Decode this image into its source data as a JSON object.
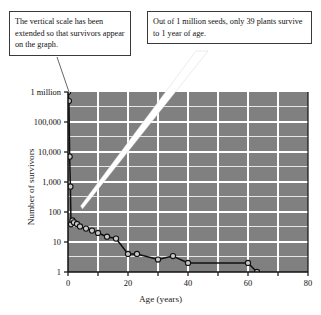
{
  "annotations": {
    "scale_note": "The vertical scale has been extended so that survivors appear on the graph.",
    "survival_note": "Out of 1 million seeds, only 39 plants survive to 1 year of age.",
    "caption": ""
  },
  "chart_data": {
    "type": "line",
    "title": "",
    "subtitle": "",
    "xlabel": "Age (years)",
    "ylabel": "Number of survivors",
    "xlim": [
      0,
      80
    ],
    "ylim": [
      1,
      1000000
    ],
    "yscale": "log",
    "grid": true,
    "legend": false,
    "plot_background": "#808080",
    "grid_color": "#ffffff",
    "marker": "open-circle",
    "x_ticks": [
      0,
      10,
      20,
      30,
      40,
      50,
      60,
      70,
      80
    ],
    "x_tick_labels": [
      "0",
      "",
      "20",
      "",
      "40",
      "",
      "60",
      "",
      "80"
    ],
    "y_ticks": [
      1,
      10,
      100,
      1000,
      10000,
      100000,
      1000000
    ],
    "y_tick_labels": [
      "1",
      "10",
      "100",
      "1,000",
      "10,000",
      "100,000",
      "1 million"
    ],
    "series": [
      {
        "name": "Survivors",
        "x": [
          0,
          0.3,
          0.55,
          0.8,
          1,
          1.5,
          2,
          3,
          4,
          6,
          8,
          10,
          13,
          16,
          20,
          23,
          30,
          35,
          40,
          60,
          63
        ],
        "values": [
          1000000,
          500000,
          7000,
          700,
          39,
          52,
          45,
          40,
          33,
          28,
          24,
          20,
          15,
          13,
          4.0,
          4.0,
          2.6,
          3.4,
          2.0,
          2.0,
          1.0
        ]
      }
    ],
    "annotated_points": [
      {
        "x": 0,
        "y": 1000000,
        "note": "1 million seeds"
      },
      {
        "x": 1,
        "y": 39,
        "note": "39 plants survive to 1 year"
      }
    ]
  }
}
